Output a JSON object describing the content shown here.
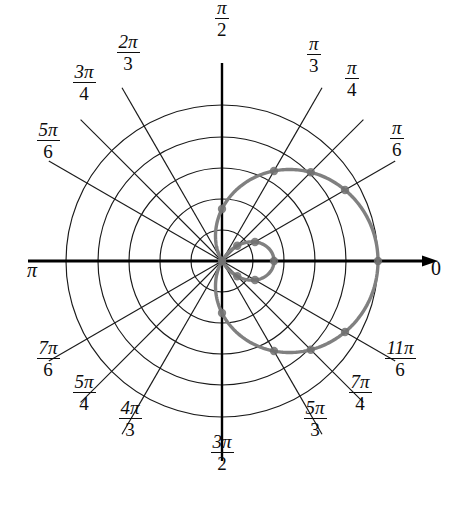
{
  "figure": {
    "kind": "polar-plot",
    "background_color": "#ffffff",
    "grid_color": "#1a1a1a",
    "axis_color": "#000000",
    "curve_color": "#808080",
    "marker_color": "#707070",
    "label_color": "#0d0d0d"
  },
  "angle_labels": [
    {
      "id": "theta-0",
      "text": "0",
      "numerator": "0",
      "denominator": "",
      "style": "plain",
      "angle_deg": 0,
      "x": 436,
      "y": 268
    },
    {
      "id": "theta-pi-6",
      "text": "π/6",
      "numerator": "π",
      "denominator": "6",
      "style": "fraction",
      "angle_deg": 30,
      "x": 397,
      "y": 138
    },
    {
      "id": "theta-pi-4",
      "text": "π/4",
      "numerator": "π",
      "denominator": "4",
      "style": "fraction",
      "angle_deg": 45,
      "x": 352,
      "y": 78
    },
    {
      "id": "theta-pi-3",
      "text": "π/3",
      "numerator": "π",
      "denominator": "3",
      "style": "fraction",
      "angle_deg": 60,
      "x": 314,
      "y": 54
    },
    {
      "id": "theta-pi-2",
      "text": "π/2",
      "numerator": "π",
      "denominator": "2",
      "style": "fraction",
      "angle_deg": 90,
      "x": 222,
      "y": 18
    },
    {
      "id": "theta-2pi-3",
      "text": "2π/3",
      "numerator": "2π",
      "denominator": "3",
      "style": "fraction",
      "angle_deg": 120,
      "x": 128,
      "y": 52
    },
    {
      "id": "theta-3pi-4",
      "text": "3π/4",
      "numerator": "3π",
      "denominator": "4",
      "style": "fraction",
      "angle_deg": 135,
      "x": 84,
      "y": 82
    },
    {
      "id": "theta-5pi-6",
      "text": "5π/6",
      "numerator": "5π",
      "denominator": "6",
      "style": "fraction",
      "angle_deg": 150,
      "x": 48,
      "y": 140
    },
    {
      "id": "theta-pi",
      "text": "π",
      "numerator": "π",
      "denominator": "",
      "style": "plain",
      "angle_deg": 180,
      "x": 32,
      "y": 270
    },
    {
      "id": "theta-7pi-6",
      "text": "7π/6",
      "numerator": "7π",
      "denominator": "6",
      "style": "fraction",
      "angle_deg": 210,
      "x": 48,
      "y": 358
    },
    {
      "id": "theta-5pi-4",
      "text": "5π/4",
      "numerator": "5π",
      "denominator": "4",
      "style": "fraction",
      "angle_deg": 225,
      "x": 84,
      "y": 392
    },
    {
      "id": "theta-4pi-3",
      "text": "4π/3",
      "numerator": "4π",
      "denominator": "3",
      "style": "fraction",
      "angle_deg": 240,
      "x": 130,
      "y": 418
    },
    {
      "id": "theta-3pi-2",
      "text": "3π/2",
      "numerator": "3π",
      "denominator": "2",
      "style": "fraction",
      "angle_deg": 270,
      "x": 222,
      "y": 452
    },
    {
      "id": "theta-5pi-3",
      "text": "5π/3",
      "numerator": "5π",
      "denominator": "3",
      "style": "fraction",
      "angle_deg": 300,
      "x": 315,
      "y": 418
    },
    {
      "id": "theta-7pi-4",
      "text": "7π/4",
      "numerator": "7π",
      "denominator": "4",
      "style": "fraction",
      "angle_deg": 315,
      "x": 360,
      "y": 392
    },
    {
      "id": "theta-11pi-6",
      "text": "11π/6",
      "numerator": "11π",
      "denominator": "6",
      "style": "fraction",
      "angle_deg": 330,
      "x": 400,
      "y": 358
    }
  ],
  "chart_data": {
    "type": "line",
    "coordinate_system": "polar",
    "title": "",
    "xlabel": "",
    "ylabel": "",
    "equation": "r = 1 + 2 cos(theta)",
    "theta_unit": "radians",
    "grid": true,
    "legend": false,
    "center_px": {
      "x": 222,
      "y": 261
    },
    "radial_grid_circles": 5,
    "radial_tick_values": [
      0.6,
      1.2,
      1.8,
      2.4,
      3.0
    ],
    "radial_tick_radius_px": [
      31,
      62,
      93,
      124,
      156
    ],
    "rlim": [
      0,
      3
    ],
    "angle_tick_deg": [
      0,
      30,
      45,
      60,
      90,
      120,
      135,
      150,
      180,
      210,
      225,
      240,
      270,
      300,
      315,
      330
    ],
    "theta": [
      0,
      30,
      45,
      60,
      90,
      120,
      135,
      150,
      180,
      210,
      225,
      240,
      270,
      300,
      315,
      330
    ],
    "r": [
      3.0,
      2.732,
      2.414,
      2.0,
      1.0,
      0.0,
      -0.414,
      -0.732,
      -1.0,
      -0.732,
      -0.414,
      0.0,
      1.0,
      2.0,
      2.414,
      2.732
    ],
    "marker_points": [
      {
        "theta_deg": 0,
        "r": 3.0,
        "label": "(3, 0)"
      },
      {
        "theta_deg": 30,
        "r": 2.732,
        "label": "(2.73, π/6)"
      },
      {
        "theta_deg": 45,
        "r": 2.414,
        "label": "(2.41, π/4)"
      },
      {
        "theta_deg": 60,
        "r": 2.0,
        "label": "(2, π/3)"
      },
      {
        "theta_deg": 90,
        "r": 1.0,
        "label": "(1, π/2)"
      },
      {
        "theta_deg": 120,
        "r": 0.0,
        "label": "(0, 2π/3)"
      },
      {
        "theta_deg": 135,
        "r": -0.414,
        "label": "(-0.41, 3π/4)"
      },
      {
        "theta_deg": 150,
        "r": -0.732,
        "label": "(-0.73, 5π/6)"
      },
      {
        "theta_deg": 180,
        "r": -1.0,
        "label": "(-1, π)"
      },
      {
        "theta_deg": 210,
        "r": -0.732,
        "label": "(-0.73, 7π/6)"
      },
      {
        "theta_deg": 225,
        "r": -0.414,
        "label": "(-0.41, 5π/4)"
      },
      {
        "theta_deg": 240,
        "r": 0.0,
        "label": "(0, 4π/3)"
      },
      {
        "theta_deg": 270,
        "r": 1.0,
        "label": "(1, 3π/2)"
      },
      {
        "theta_deg": 300,
        "r": 2.0,
        "label": "(2, 5π/3)"
      },
      {
        "theta_deg": 315,
        "r": 2.414,
        "label": "(2.41, 7π/4)"
      },
      {
        "theta_deg": 330,
        "r": 2.732,
        "label": "(2.73, 11π/6)"
      }
    ]
  }
}
